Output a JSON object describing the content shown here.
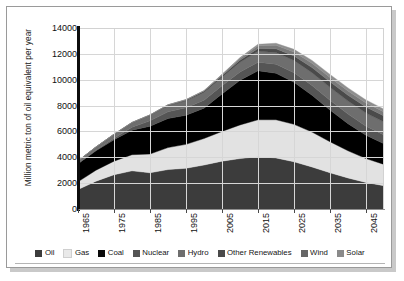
{
  "chart_data": {
    "type": "area",
    "stacked": true,
    "title": "",
    "subtitle": "",
    "xlabel": "",
    "ylabel": "Million metric ton of oil equivalent per year",
    "xlim": [
      1965,
      2050
    ],
    "ylim": [
      0,
      14000
    ],
    "ytick_labels": [
      "14000",
      "12000",
      "10000",
      "8000",
      "6000",
      "4000",
      "2000",
      "0"
    ],
    "ytick_values": [
      14000,
      12000,
      10000,
      8000,
      6000,
      4000,
      2000,
      0
    ],
    "xtick_labels": [
      "1965",
      "1975",
      "1985",
      "1995",
      "2005",
      "2015",
      "2025",
      "2035",
      "2045"
    ],
    "xtick_values": [
      1965,
      1975,
      1985,
      1995,
      2005,
      2015,
      2025,
      2035,
      2045
    ],
    "grid": true,
    "legend_position": "bottom",
    "x": [
      1965,
      1970,
      1975,
      1980,
      1985,
      1990,
      1995,
      2000,
      2005,
      2010,
      2015,
      2020,
      2025,
      2030,
      2035,
      2040,
      2045,
      2050
    ],
    "series": [
      {
        "name": "Oil",
        "color": "#3c3c3c",
        "values": [
          1500,
          2150,
          2650,
          2950,
          2800,
          3050,
          3150,
          3400,
          3700,
          3900,
          4050,
          3950,
          3650,
          3250,
          2800,
          2400,
          2050,
          1800
        ]
      },
      {
        "name": "Gas",
        "color": "#e2e2e2",
        "values": [
          600,
          850,
          1050,
          1250,
          1450,
          1700,
          1850,
          2050,
          2300,
          2600,
          2850,
          2950,
          2900,
          2700,
          2400,
          2100,
          1850,
          1650
        ]
      },
      {
        "name": "Coal",
        "color": "#000000",
        "values": [
          1400,
          1500,
          1650,
          1900,
          2150,
          2250,
          2250,
          2350,
          2900,
          3450,
          3800,
          3600,
          3250,
          2850,
          2450,
          2100,
          1800,
          1600
        ]
      },
      {
        "name": "Nuclear",
        "color": "#555555",
        "values": [
          10,
          40,
          120,
          220,
          420,
          520,
          580,
          620,
          640,
          650,
          660,
          700,
          740,
          760,
          760,
          740,
          710,
          680
        ]
      },
      {
        "name": "Hydro",
        "color": "#6e6e6e",
        "values": [
          200,
          250,
          300,
          350,
          420,
          480,
          540,
          600,
          660,
          750,
          840,
          900,
          950,
          980,
          1000,
          1010,
          1010,
          1000
        ]
      },
      {
        "name": "Other Renewables",
        "color": "#4a4a4a",
        "values": [
          5,
          8,
          12,
          20,
          30,
          45,
          60,
          80,
          110,
          160,
          220,
          290,
          350,
          400,
          430,
          450,
          460,
          465
        ]
      },
      {
        "name": "Wind",
        "color": "#7a7a7a",
        "values": [
          0,
          0,
          1,
          3,
          6,
          12,
          25,
          45,
          80,
          140,
          210,
          270,
          310,
          330,
          335,
          330,
          320,
          310
        ]
      },
      {
        "name": "Solar",
        "color": "#8f8f8f",
        "values": [
          0,
          0,
          0,
          1,
          2,
          4,
          8,
          15,
          30,
          60,
          110,
          160,
          200,
          225,
          235,
          235,
          230,
          220
        ]
      }
    ],
    "totals": [
      3715,
      4798,
      5783,
      6694,
      7278,
      8061,
      8463,
      9160,
      10420,
      11710,
      12740,
      12820,
      12350,
      11495,
      10410,
      9365,
      8430,
      7725
    ],
    "peak_year": 2020,
    "peak_value": 12820
  },
  "legend": {
    "items": [
      {
        "label": "Oil",
        "color": "#3c3c3c"
      },
      {
        "label": "Gas",
        "color": "#e9e9e9"
      },
      {
        "label": "Coal",
        "color": "#0a0a0a"
      },
      {
        "label": "Nuclear",
        "color": "#555555"
      },
      {
        "label": "Hydro",
        "color": "#6e6e6e"
      },
      {
        "label": "Other Renewables",
        "color": "#4a4a4a"
      },
      {
        "label": "Wind",
        "color": "#666666"
      },
      {
        "label": "Solar",
        "color": "#8a8a8a"
      }
    ]
  }
}
